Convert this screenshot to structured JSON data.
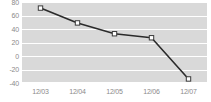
{
  "chart_data": {
    "type": "line",
    "title": "",
    "subtitle": "",
    "xlabel": "",
    "ylabel": "",
    "categories": [
      "12/03",
      "12/04",
      "12/05",
      "12/06",
      "12/07"
    ],
    "values": [
      71,
      49,
      33,
      27,
      -34
    ],
    "series": [
      {
        "name": "series-1",
        "values": [
          71,
          49,
          33,
          27,
          -34
        ]
      }
    ],
    "ylim": [
      -40,
      80
    ],
    "yticks": [
      80,
      60,
      40,
      20,
      0,
      -20,
      -40
    ],
    "ytick_labels": [
      "80",
      "60",
      "40",
      "20",
      "0",
      "-20",
      "-40"
    ],
    "xtick_labels": [
      "12/03",
      "12/04",
      "12/05",
      "12/06",
      "12/07"
    ],
    "grid": true,
    "grid_axis": "y",
    "legend": false,
    "legend_position": "none",
    "annotations": [],
    "colors": {
      "plot_background": "#d9d9d9",
      "figure_background": "#ffffff",
      "gridline": "#ffffff",
      "line": "#2b2b2b",
      "marker_fill": "#ffffff",
      "marker_edge": "#3a3a3a",
      "tick_label": "#8a8a8a"
    },
    "marker": "square",
    "line_width": 1.6
  }
}
